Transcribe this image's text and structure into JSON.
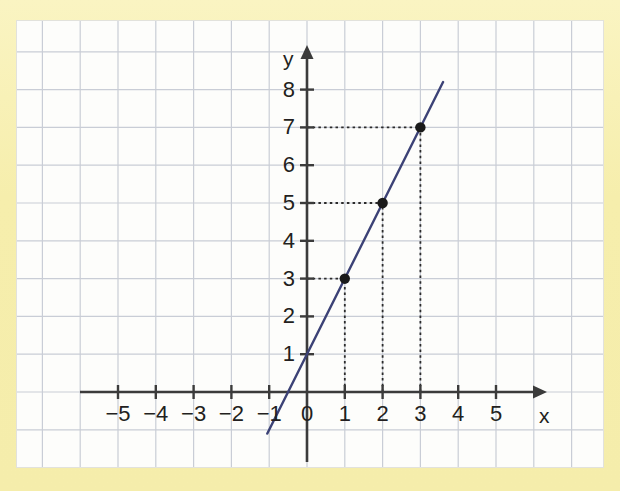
{
  "figure": {
    "background_color": "#f6eeac",
    "panel_color": "#fdfdfb",
    "grid_color": "#c9cdd6",
    "axis_color": "#3b3b3b",
    "line_color": "#3c4276",
    "point_color": "#1a1a1a",
    "dashed_color": "#2b2b2b"
  },
  "chart_data": {
    "type": "line",
    "title": "",
    "xlabel": "x",
    "ylabel": "y",
    "xlim": [
      -5.9,
      6.2
    ],
    "ylim": [
      -1.9,
      9.1
    ],
    "grid": true,
    "legend": "none",
    "x_ticks": [
      -5,
      -4,
      -3,
      -2,
      -1,
      0,
      1,
      2,
      3,
      4,
      5
    ],
    "x_tick_labels": [
      "−5",
      "−4",
      "−3",
      "−2",
      "−1",
      "0",
      "1",
      "2",
      "3",
      "4",
      "5"
    ],
    "y_ticks": [
      1,
      2,
      3,
      4,
      5,
      6,
      7,
      8
    ],
    "y_tick_labels": [
      "1",
      "2",
      "3",
      "4",
      "5",
      "6",
      "7",
      "8"
    ],
    "series": [
      {
        "name": "y = 2x + 1",
        "type": "line",
        "slope": 2,
        "intercept": 1,
        "draw_from": {
          "x": -1.05,
          "y": -1.1
        },
        "draw_to": {
          "x": 3.6,
          "y": 8.2
        },
        "color": "#3c4276"
      }
    ],
    "points": [
      {
        "x": 1,
        "y": 3,
        "label": "(1, 3)"
      },
      {
        "x": 2,
        "y": 5,
        "label": "(2, 5)"
      },
      {
        "x": 3,
        "y": 7,
        "label": "(3, 7)"
      }
    ],
    "guide_lines": [
      {
        "from": {
          "x": 0,
          "y": 3
        },
        "to": {
          "x": 1,
          "y": 3
        },
        "style": "dotted"
      },
      {
        "from": {
          "x": 1,
          "y": 0
        },
        "to": {
          "x": 1,
          "y": 3
        },
        "style": "dotted"
      },
      {
        "from": {
          "x": 0,
          "y": 5
        },
        "to": {
          "x": 2,
          "y": 5
        },
        "style": "dotted"
      },
      {
        "from": {
          "x": 2,
          "y": 0
        },
        "to": {
          "x": 2,
          "y": 5
        },
        "style": "dotted"
      },
      {
        "from": {
          "x": 0,
          "y": 7
        },
        "to": {
          "x": 3,
          "y": 7
        },
        "style": "dotted"
      },
      {
        "from": {
          "x": 3,
          "y": 0
        },
        "to": {
          "x": 3,
          "y": 7
        },
        "style": "dotted"
      }
    ],
    "axis_arrows": {
      "x": "right",
      "y": "up"
    }
  }
}
